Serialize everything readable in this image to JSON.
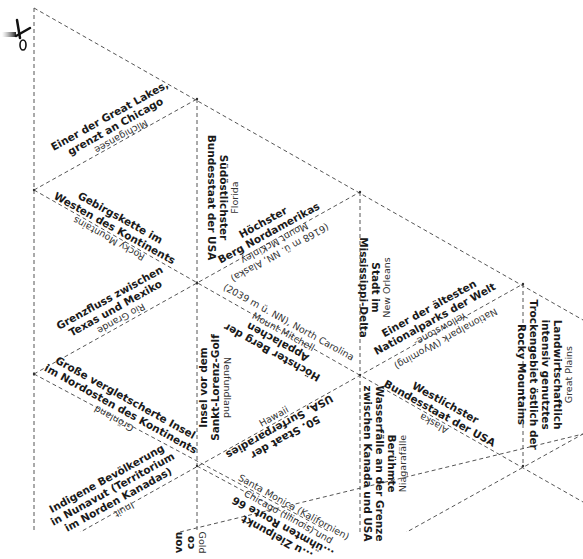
{
  "worksheet": {
    "title": "Triangle puzzle cards – North America geography",
    "cut_icon": "scissors-icon",
    "line_color": "#555555",
    "tiles": [
      {
        "id": "michigansee",
        "clue": "Einer der Great Lakes, grenzt an Chicago",
        "clue_lines": [
          "Einer der Great Lakes,",
          "grenzt an Chicago"
        ],
        "answer": "Michigansee"
      },
      {
        "id": "florida",
        "clue_lines": [
          "Südöstlichster",
          "Bundesstaat der USA"
        ],
        "answer": "Florida"
      },
      {
        "id": "mckinley",
        "clue_lines": [
          "Höchster",
          "Berg Nordamerikas"
        ],
        "answer_lines": [
          "Mount McKinley",
          "(6168 m ü. NN, Alaska)"
        ]
      },
      {
        "id": "rocky",
        "clue_lines": [
          "Gebirgskette im",
          "Westen des Kontinents"
        ],
        "answer": "Rocky Mountains"
      },
      {
        "id": "neworleans",
        "clue_lines": [
          "Stadt im",
          "Mississippi-Delta"
        ],
        "answer": "New Orleans"
      },
      {
        "id": "riogrande",
        "clue_lines": [
          "Grenzfluss zwischen",
          "Texas und Mexiko"
        ],
        "answer": "Rio Grande"
      },
      {
        "id": "mitchell",
        "clue_lines": [
          "Höchster Berg der",
          "Appalachen"
        ],
        "answer_lines": [
          "Mount Mitchell",
          "(2039 m ü. NN), North Carolina"
        ]
      },
      {
        "id": "yellowstone",
        "clue_lines": [
          "Einer der ältesten",
          "Nationalparks der Welt"
        ],
        "answer_lines": [
          "Yellowstone-",
          "Nationalpark (Wyoming)"
        ]
      },
      {
        "id": "neufundland",
        "clue_lines": [
          "Insel vor dem",
          "Sankt-Lorenz-Golf"
        ],
        "answer": "Neufundland"
      },
      {
        "id": "greatplains",
        "clue_lines": [
          "Landwirtschaftlich",
          "intensiv genutztes",
          "Trockengebiet östlich der",
          "Rocky Mountains"
        ],
        "answer": "Great Plains"
      },
      {
        "id": "groenland",
        "clue_lines": [
          "Große vergletscherte Insel",
          "im Nordosten des Kontinents"
        ],
        "answer": "Grönland"
      },
      {
        "id": "hawaii",
        "clue_lines": [
          "50. Staat der",
          "USA, Surferparadies"
        ],
        "answer": "Hawaii"
      },
      {
        "id": "alaska",
        "clue_lines": [
          "Westlichster",
          "Bundesstaat der USA"
        ],
        "answer": "Alaska"
      },
      {
        "id": "niagara",
        "clue_lines": [
          "Berühmte",
          "Wasserfälle an der Grenze",
          "zwischen Kanada und USA"
        ],
        "answer": "Niagarafälle"
      },
      {
        "id": "inuit",
        "clue_lines": [
          "Indigene Bevölkerung",
          "in Nunavut (Territorium",
          "im Norden Kanadas)"
        ],
        "answer": "Inuit"
      },
      {
        "id": "route66",
        "clue_lines": [
          "...ühmten Route 66",
          "...u Zielpunkt"
        ],
        "answer_lines": [
          "Chicago (Illinois) und",
          "Santa Monica (Kalifornien)"
        ]
      },
      {
        "id": "partial_von",
        "clue_lines": [
          "von",
          "co"
        ],
        "answer": "Gold"
      }
    ]
  }
}
